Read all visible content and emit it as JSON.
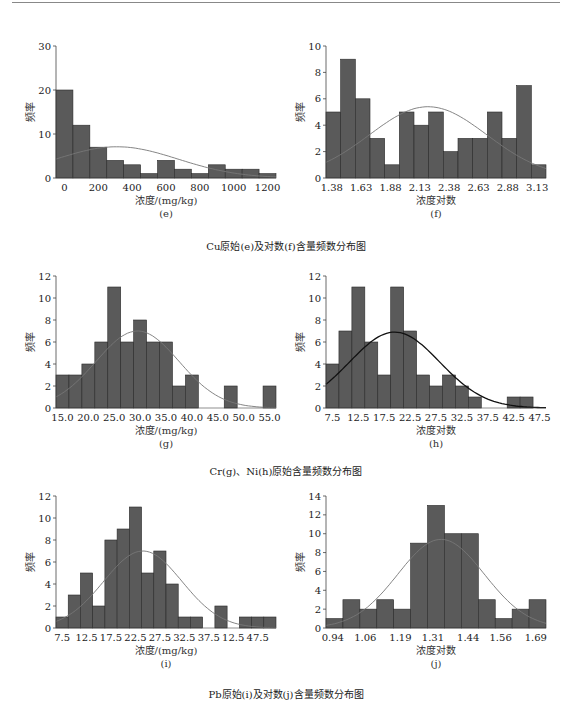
{
  "page": {
    "captions": [
      "Cu原始(e)及对数(f)含量频数分布图",
      "Cr(g)、Ni(h)原始含量频数分布图",
      "Pb原始(i)及对数(j)含量频数分布图"
    ]
  },
  "colors": {
    "bar": "#5a5a5a",
    "bar_edge": "#2a2a2a",
    "curve_light": "#777777",
    "curve_dark": "#111111",
    "axis": "#444444"
  },
  "chart_data": [
    {
      "id": "e",
      "type": "bar",
      "title": "",
      "sublabel": "(e)",
      "xlabel": "浓度/(mg/kg)",
      "ylabel": "频率",
      "bin_start": -50,
      "bin_width": 100,
      "values": [
        20,
        12,
        7,
        4,
        3,
        1,
        4,
        2,
        1,
        3,
        2,
        2,
        1
      ],
      "xlim": [
        -50,
        1250
      ],
      "ylim": [
        0,
        30
      ],
      "xticks": [
        0,
        200,
        400,
        600,
        800,
        1000,
        1200
      ],
      "xtick_labels": [
        "0",
        "200",
        "400",
        "600",
        "800",
        "1000",
        "1200"
      ],
      "yticks": [
        0,
        10,
        20,
        30
      ],
      "normal_curve": {
        "mean": 310,
        "sd": 360,
        "peak": 7.1,
        "style": "light"
      },
      "grid": false,
      "legend": null
    },
    {
      "id": "f",
      "type": "bar",
      "title": "",
      "sublabel": "(f)",
      "xlabel": "浓度对数",
      "ylabel": "频率",
      "bin_start": 1.33,
      "bin_width": 0.125,
      "values": [
        5,
        9,
        6,
        3,
        1,
        5,
        4,
        5,
        2,
        3,
        3,
        5,
        3,
        7,
        1
      ],
      "xlim": [
        1.33,
        3.205
      ],
      "ylim": [
        0,
        10
      ],
      "xticks": [
        1.38,
        1.63,
        1.88,
        2.13,
        2.38,
        2.63,
        2.88,
        3.13
      ],
      "xtick_labels": [
        "1.38",
        "1.63",
        "1.88",
        "2.13",
        "2.38",
        "2.63",
        "2.88",
        "3.13"
      ],
      "yticks": [
        0,
        2,
        4,
        6,
        8,
        10
      ],
      "normal_curve": {
        "mean": 2.2,
        "sd": 0.5,
        "peak": 5.4,
        "style": "light"
      },
      "grid": false,
      "legend": null
    },
    {
      "id": "g",
      "type": "bar",
      "title": "",
      "sublabel": "(g)",
      "xlabel": "浓度/(mg/kg)",
      "ylabel": "频率",
      "bin_start": 13.75,
      "bin_width": 2.5,
      "values": [
        3,
        3,
        4,
        6,
        11,
        6,
        8,
        6,
        6,
        2,
        3,
        0,
        0,
        2,
        0,
        0,
        2
      ],
      "xlim": [
        13.75,
        56.25
      ],
      "ylim": [
        0,
        12
      ],
      "xticks": [
        15,
        20,
        25,
        30,
        35,
        40,
        45,
        50,
        55
      ],
      "xtick_labels": [
        "15.0",
        "20.0",
        "25.0",
        "30.0",
        "35.0",
        "40.0",
        "45.0",
        "50.0",
        "55.0"
      ],
      "yticks": [
        0,
        2,
        4,
        6,
        8,
        10,
        12
      ],
      "normal_curve": {
        "mean": 29.5,
        "sd": 8.0,
        "peak": 7.0,
        "style": "light"
      },
      "grid": false,
      "legend": null
    },
    {
      "id": "h",
      "type": "bar",
      "title": "",
      "sublabel": "(h)",
      "xlabel": "浓度对数",
      "ylabel": "频率",
      "bin_start": 6.25,
      "bin_width": 2.5,
      "values": [
        4,
        7,
        11,
        6,
        3,
        11,
        7,
        3,
        2,
        3,
        2,
        1,
        0,
        0,
        1,
        1
      ],
      "xlim": [
        6.25,
        48.75
      ],
      "ylim": [
        0,
        12
      ],
      "xticks": [
        7.5,
        12.5,
        17.5,
        22.5,
        27.5,
        32.5,
        37.5,
        42.5,
        47.5
      ],
      "xtick_labels": [
        "7.5",
        "12.5",
        "17.5",
        "22.5",
        "27.5",
        "32.5",
        "37.5",
        "42.5",
        "47.5"
      ],
      "yticks": [
        0,
        2,
        4,
        6,
        8,
        10,
        12
      ],
      "normal_curve": {
        "mean": 19.5,
        "sd": 8.7,
        "peak": 6.9,
        "style": "dark"
      },
      "grid": false,
      "legend": null
    },
    {
      "id": "i",
      "type": "bar",
      "title": "",
      "sublabel": "(i)",
      "xlabel": "浓度/(mg/kg)",
      "ylabel": "频率",
      "bin_start": 6.25,
      "bin_width": 2.5,
      "values": [
        1,
        3,
        5,
        2,
        8,
        9,
        11,
        5,
        7,
        4,
        1,
        1,
        0,
        2,
        0,
        1,
        1,
        1
      ],
      "xlim": [
        6.25,
        51.25
      ],
      "ylim": [
        0,
        12
      ],
      "xticks": [
        7.5,
        12.5,
        17.5,
        22.5,
        27.5,
        32.5,
        37.5,
        42.5,
        47.5
      ],
      "xtick_labels": [
        "7.5",
        "12.5",
        "17.5",
        "22.5",
        "27.5",
        "32.5",
        "37.5",
        "12.5",
        "47.5"
      ],
      "yticks": [
        0,
        2,
        4,
        6,
        8,
        10,
        12
      ],
      "normal_curve": {
        "mean": 24.0,
        "sd": 8.0,
        "peak": 7.0,
        "style": "light"
      },
      "grid": false,
      "legend": null
    },
    {
      "id": "j",
      "type": "bar",
      "title": "",
      "sublabel": "(j)",
      "xlabel": "浓度对数",
      "ylabel": "频率",
      "bin_start": 0.915,
      "bin_width": 0.0625,
      "values": [
        1,
        3,
        2,
        3,
        2,
        9,
        13,
        10,
        10,
        3,
        1,
        2,
        3
      ],
      "xlim": [
        0.915,
        1.7275
      ],
      "ylim": [
        0,
        14
      ],
      "xticks": [
        0.94,
        1.06,
        1.19,
        1.31,
        1.44,
        1.56,
        1.69
      ],
      "xtick_labels": [
        "0.94",
        "1.06",
        "1.19",
        "1.31",
        "1.44",
        "1.56",
        "1.69"
      ],
      "yticks": [
        0,
        2,
        4,
        6,
        8,
        10,
        12,
        14
      ],
      "normal_curve": {
        "mean": 1.34,
        "sd": 0.16,
        "peak": 9.4,
        "style": "light"
      },
      "grid": false,
      "legend": null
    }
  ]
}
